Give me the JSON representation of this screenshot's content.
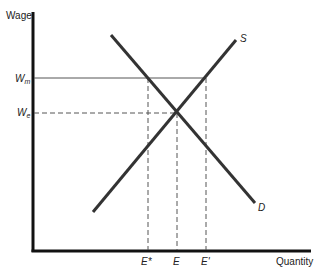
{
  "diagram": {
    "type": "supply-demand",
    "axes": {
      "y_label": "Wage",
      "x_label": "Quantity"
    },
    "wage_levels": [
      {
        "id": "Wm",
        "main": "W",
        "sub": "m",
        "style": "solid"
      },
      {
        "id": "We",
        "main": "W",
        "sub": "e",
        "style": "dashed"
      }
    ],
    "quantity_levels": [
      {
        "id": "E*",
        "label": "E*"
      },
      {
        "id": "E",
        "label": "E"
      },
      {
        "id": "E'",
        "label": "E'"
      }
    ],
    "curves": [
      {
        "id": "S",
        "label": "S",
        "name": "supply"
      },
      {
        "id": "D",
        "label": "D",
        "name": "demand"
      }
    ],
    "colors": {
      "axis": "#111111",
      "curve": "#333333",
      "guide": "#555555"
    }
  }
}
